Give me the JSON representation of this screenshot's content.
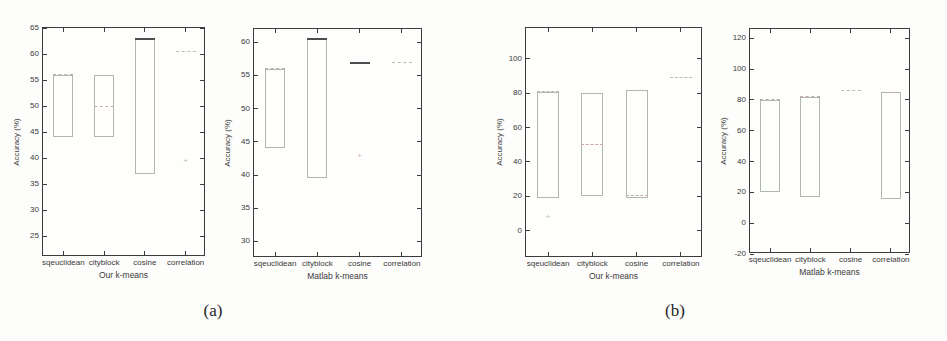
{
  "figure": {
    "caption_a": "(a)",
    "caption_b": "(b)"
  },
  "colors": {
    "axis": "#3c3c3c",
    "tick_text": "#3a3a3a",
    "box_outline": "#aeb7b2",
    "median_light": "#c9aba6",
    "median_strong": "#4d4d4d",
    "degenerate_light": "#b4bdb7",
    "outlier": "#c9b4ae",
    "background": "#fdfdfb"
  },
  "chart_data": [
    {
      "type": "boxplot",
      "panel": "a-left",
      "title": "",
      "xlabel": "Our k-means",
      "ylabel": "Accuracy (%)",
      "categories": [
        "sqeuclidean",
        "cityblock",
        "cosine",
        "correlation"
      ],
      "ylim": [
        21,
        65
      ],
      "yticks": [
        65,
        60,
        55,
        50,
        45,
        40,
        35,
        30,
        25
      ],
      "grid": false,
      "boxes": [
        {
          "category": "sqeuclidean",
          "q1": 44,
          "q3": 56,
          "median": 56,
          "degenerate": false,
          "strong": false,
          "outliers": []
        },
        {
          "category": "cityblock",
          "q1": 44,
          "q3": 56,
          "median": 50,
          "degenerate": false,
          "strong": false,
          "outliers": []
        },
        {
          "category": "cosine",
          "q1": 37,
          "q3": 63,
          "median": 63,
          "degenerate": false,
          "strong": true,
          "outliers": []
        },
        {
          "category": "correlation",
          "q1": 60.5,
          "q3": 60.5,
          "median": 60.5,
          "degenerate": true,
          "strong": false,
          "outliers": [
            39.5
          ]
        }
      ]
    },
    {
      "type": "boxplot",
      "panel": "a-right",
      "title": "",
      "xlabel": "Matlab k-means",
      "ylabel": "Accuracy (%)",
      "categories": [
        "sqeuclidean",
        "cityblock",
        "cosine",
        "correlation"
      ],
      "ylim": [
        27.5,
        62
      ],
      "yticks": [
        60,
        55,
        50,
        45,
        40,
        35,
        30
      ],
      "grid": false,
      "boxes": [
        {
          "category": "sqeuclidean",
          "q1": 44,
          "q3": 56,
          "median": 56,
          "degenerate": false,
          "strong": false,
          "outliers": []
        },
        {
          "category": "cityblock",
          "q1": 39.5,
          "q3": 60.5,
          "median": 60.5,
          "degenerate": false,
          "strong": true,
          "outliers": []
        },
        {
          "category": "cosine",
          "q1": 57,
          "q3": 57,
          "median": 57,
          "degenerate": true,
          "strong": true,
          "outliers": [
            43
          ]
        },
        {
          "category": "correlation",
          "q1": 57,
          "q3": 57,
          "median": 57,
          "degenerate": true,
          "strong": false,
          "outliers": []
        }
      ]
    },
    {
      "type": "boxplot",
      "panel": "b-left",
      "title": "",
      "xlabel": "Our k-means",
      "ylabel": "Accuracy (%)",
      "categories": [
        "sqeuclidean",
        "cityblock",
        "cosine",
        "correlation"
      ],
      "ylim": [
        -16,
        118
      ],
      "yticks": [
        100,
        80,
        60,
        40,
        20,
        0
      ],
      "grid": false,
      "boxes": [
        {
          "category": "sqeuclidean",
          "q1": 19,
          "q3": 81,
          "median": 81,
          "degenerate": false,
          "strong": false,
          "outliers": [
            8
          ]
        },
        {
          "category": "cityblock",
          "q1": 20,
          "q3": 80,
          "median": 50,
          "degenerate": false,
          "strong": false,
          "outliers": []
        },
        {
          "category": "cosine",
          "q1": 19,
          "q3": 82,
          "median": 20.5,
          "degenerate": false,
          "strong": false,
          "outliers": []
        },
        {
          "category": "correlation",
          "q1": 89,
          "q3": 89,
          "median": 89,
          "degenerate": true,
          "strong": false,
          "outliers": []
        }
      ]
    },
    {
      "type": "boxplot",
      "panel": "b-right",
      "title": "",
      "xlabel": "Matlab k-means",
      "ylabel": "Accuracy (%)",
      "categories": [
        "sqeuclidean",
        "cityblock",
        "cosine",
        "correlation"
      ],
      "ylim": [
        -20,
        126
      ],
      "yticks": [
        120,
        100,
        80,
        60,
        40,
        20,
        0,
        -20
      ],
      "grid": false,
      "boxes": [
        {
          "category": "sqeuclidean",
          "q1": 20,
          "q3": 80,
          "median": 80,
          "degenerate": false,
          "strong": false,
          "outliers": []
        },
        {
          "category": "cityblock",
          "q1": 17,
          "q3": 82,
          "median": 82,
          "degenerate": false,
          "strong": false,
          "outliers": []
        },
        {
          "category": "cosine",
          "q1": 86,
          "q3": 86,
          "median": 86,
          "degenerate": true,
          "strong": false,
          "outliers": []
        },
        {
          "category": "correlation",
          "q1": 16,
          "q3": 85,
          "median": 85,
          "degenerate": false,
          "strong": false,
          "outliers": []
        }
      ]
    }
  ]
}
